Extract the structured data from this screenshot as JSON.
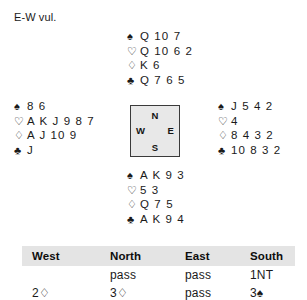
{
  "vulnerability": "E-W vul.",
  "suit_symbols": {
    "spade": "♠",
    "heart": "♡",
    "diamond": "♢",
    "club": "♣"
  },
  "hands": {
    "north": {
      "position": "North",
      "spades": "Q 10 7",
      "hearts": "Q 10 6 2",
      "diamonds": "K 6",
      "clubs": "Q 7 6 5"
    },
    "west": {
      "position": "West",
      "spades": "8 6",
      "hearts": "A K J 9 8 7",
      "diamonds": "A J 10 9",
      "clubs": "J"
    },
    "east": {
      "position": "East",
      "spades": "J 5 4 2",
      "hearts": "4",
      "diamonds": "8 4 3 2",
      "clubs": "10 8 3 2"
    },
    "south": {
      "position": "South",
      "spades": "A K 9 3",
      "hearts": "5 3",
      "diamonds": "Q 7 5",
      "clubs": "A K 9 4"
    }
  },
  "compass": {
    "north": "N",
    "south": "S",
    "west": "W",
    "east": "E"
  },
  "bidding": {
    "headers": [
      "West",
      "North",
      "East",
      "South"
    ],
    "rows": [
      {
        "west": "",
        "north": "pass",
        "east": "pass",
        "south": "1NT"
      },
      {
        "west": "2♢",
        "north": "3♢",
        "east": "pass",
        "south": "3♠"
      }
    ]
  },
  "colors": {
    "text": "#1a1a1a",
    "compass_fill": "#e8e8e8",
    "compass_border": "#3a3a3a",
    "table_header_fill": "#e4e4e4",
    "background": "#ffffff"
  }
}
